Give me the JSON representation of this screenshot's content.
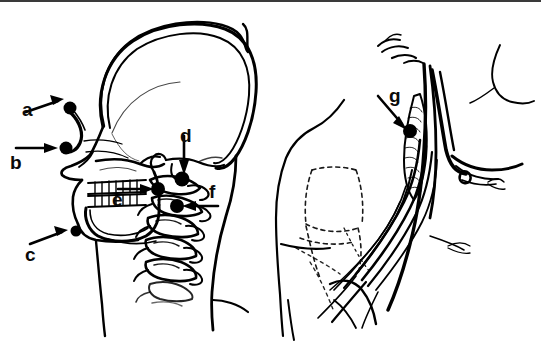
{
  "figure": {
    "background_color": "#ffffff",
    "ink_color": "#000000",
    "top_rule_color": "#3a3a3a",
    "panels": [
      {
        "id": "left-panel",
        "name": "lateral-head-neck-view",
        "description": "Lateral (side) view of skull, mandible with teeth, cervical vertebral column, neck and shoulder outline",
        "labels": [
          "a",
          "b",
          "c",
          "d",
          "e",
          "f"
        ]
      },
      {
        "id": "right-panel",
        "name": "supraclavicular-brachial-plexus-view",
        "description": "Anterolateral neck and shoulder showing brachial plexus trunks, subclavian vessels, clavicle outline in dashed line",
        "labels": [
          "g"
        ]
      }
    ]
  },
  "labels": {
    "a": {
      "text": "a",
      "x": 22,
      "y": 100,
      "point_x": 70,
      "point_y": 108,
      "arrow": "up-right",
      "region": "supraorbital / frontal notch point"
    },
    "b": {
      "text": "b",
      "x": 10,
      "y": 153,
      "point_x": 66,
      "point_y": 148,
      "arrow": "right",
      "region": "infraorbital point"
    },
    "c": {
      "text": "c",
      "x": 25,
      "y": 245,
      "point_x": 76,
      "point_y": 231,
      "arrow": "up-right",
      "region": "mental foramen point"
    },
    "d": {
      "text": "d",
      "x": 180,
      "y": 126,
      "point_x": 182,
      "point_y": 179,
      "arrow": "down",
      "region": "retromandibular / upper cervical point"
    },
    "e": {
      "text": "e",
      "x": 112,
      "y": 190,
      "point_x": 158,
      "point_y": 189,
      "arrow": "right",
      "region": "mandibular ramus point"
    },
    "f": {
      "text": "f",
      "x": 209,
      "y": 182,
      "point_x": 177,
      "point_y": 206,
      "arrow": "left",
      "region": "cervical transverse process point"
    },
    "g": {
      "text": "g",
      "x": 389,
      "y": 86,
      "point_x": 410,
      "point_y": 131,
      "arrow": "down-right",
      "region": "interscalene / supraclavicular brachial plexus point"
    }
  },
  "markers": [
    {
      "name": "marker-a",
      "x": 70,
      "y": 108,
      "r": 6.5
    },
    {
      "name": "marker-b",
      "x": 66,
      "y": 148,
      "r": 6.5
    },
    {
      "name": "marker-c",
      "x": 76,
      "y": 231,
      "r": 5.5
    },
    {
      "name": "marker-d",
      "x": 182,
      "y": 179,
      "r": 7.5
    },
    {
      "name": "marker-e",
      "x": 158,
      "y": 189,
      "r": 7.0
    },
    {
      "name": "marker-f",
      "x": 177,
      "y": 206,
      "r": 7.0
    },
    {
      "name": "marker-g",
      "x": 410,
      "y": 131,
      "r": 7.0
    }
  ]
}
